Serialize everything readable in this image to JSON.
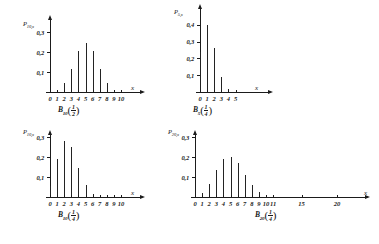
{
  "figure": {
    "axis_x_name": "x",
    "decimal_separator": ",",
    "line_color": "#1b1b1b"
  },
  "chart_data": [
    {
      "id": "panel-1",
      "type": "bar",
      "title": "",
      "caption": "B_10(1/2)",
      "caption_base": "B",
      "caption_sub": "10",
      "caption_num": "1",
      "caption_den": "2",
      "ylabel": "P_10,x",
      "ylabel_base": "P",
      "ylabel_sub": "10,x",
      "xlabel": "x",
      "categories": [
        0,
        1,
        2,
        3,
        4,
        5,
        6,
        7,
        8,
        9,
        10
      ],
      "xtick_labels": [
        "0",
        "1",
        "2",
        "3",
        "4",
        "5",
        "6",
        "7",
        "8",
        "9",
        "10"
      ],
      "values": [
        0.001,
        0.01,
        0.044,
        0.117,
        0.205,
        0.246,
        0.205,
        0.117,
        0.044,
        0.01,
        0.001
      ],
      "ytick_values": [
        0.1,
        0.2,
        0.3
      ],
      "ytick_labels": [
        "0,1",
        "0,2",
        "0,3"
      ],
      "ylim": [
        0,
        0.36
      ],
      "grid": false,
      "legend": "none"
    },
    {
      "id": "panel-2",
      "type": "bar",
      "title": "",
      "caption": "B_5(1/4)",
      "caption_base": "B",
      "caption_sub": "5",
      "caption_num": "1",
      "caption_den": "4",
      "ylabel": "P_5,x",
      "ylabel_base": "P",
      "ylabel_sub": "5,x",
      "xlabel": "x",
      "categories": [
        0,
        1,
        2,
        3,
        4,
        5
      ],
      "xtick_labels": [
        "0",
        "1",
        "2",
        "3",
        "4",
        "5"
      ],
      "values": [
        0.237,
        0.396,
        0.264,
        0.088,
        0.015,
        0.001
      ],
      "ytick_values": [
        0.1,
        0.2,
        0.3,
        0.4
      ],
      "ytick_labels": [
        "0,1",
        "0,2",
        "0,3",
        "0,4"
      ],
      "ylim": [
        0,
        0.47
      ],
      "grid": false,
      "legend": "none"
    },
    {
      "id": "panel-3",
      "type": "bar",
      "title": "",
      "caption": "B_10(1/4)",
      "caption_base": "B",
      "caption_sub": "10",
      "caption_num": "1",
      "caption_den": "4",
      "ylabel": "P_10,x",
      "ylabel_base": "P",
      "ylabel_sub": "10,x",
      "xlabel": "x",
      "categories": [
        0,
        1,
        2,
        3,
        4,
        5,
        6,
        7,
        8,
        9,
        10
      ],
      "xtick_labels": [
        "0",
        "1",
        "2",
        "3",
        "4",
        "5",
        "6",
        "7",
        "8",
        "9",
        "10"
      ],
      "values": [
        0.056,
        0.188,
        0.282,
        0.25,
        0.146,
        0.058,
        0.016,
        0.003,
        0.0004,
        0.0,
        0.0
      ],
      "ytick_values": [
        0.1,
        0.2,
        0.3
      ],
      "ytick_labels": [
        "0,1",
        "0,2",
        "0,3"
      ],
      "ylim": [
        0,
        0.36
      ],
      "grid": false,
      "legend": "none"
    },
    {
      "id": "panel-4",
      "type": "bar",
      "title": "",
      "caption": "B_20(1/4)",
      "caption_base": "B",
      "caption_sub": "20",
      "caption_num": "1",
      "caption_den": "4",
      "ylabel": "P_20,x",
      "ylabel_base": "P",
      "ylabel_sub": "20,x",
      "xlabel": "x",
      "categories": [
        0,
        1,
        2,
        3,
        4,
        5,
        6,
        7,
        8,
        9,
        10,
        11,
        15,
        20
      ],
      "xtick_labels": [
        "0",
        "1",
        "2",
        "3",
        "4",
        "5",
        "6",
        "7",
        "8",
        "9",
        "10",
        "11",
        "15",
        "20"
      ],
      "values": [
        0.003,
        0.021,
        0.067,
        0.134,
        0.19,
        0.202,
        0.169,
        0.112,
        0.061,
        0.027,
        0.01,
        0.003,
        0.0,
        0.0
      ],
      "ytick_values": [
        0.1,
        0.2,
        0.3
      ],
      "ytick_labels": [
        "0,1",
        "0,2",
        "0,3"
      ],
      "ylim": [
        0,
        0.36
      ],
      "grid": false,
      "legend": "none"
    }
  ]
}
